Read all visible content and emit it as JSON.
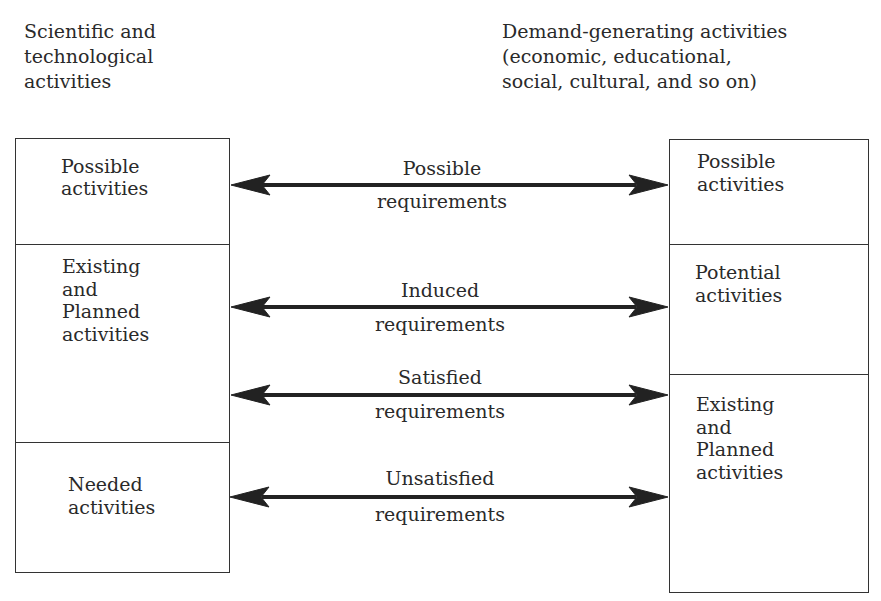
{
  "left_column": {
    "heading": "Scientific and\ntechnological\nactivities",
    "cells": [
      {
        "label": "Possible\n\nactivities"
      },
      {
        "label": "Existing\n\nand\n\nPlanned\n\nactivities"
      },
      {
        "label": "Needed\n\nactivities"
      }
    ]
  },
  "right_column": {
    "heading": "Demand-generating activities\n(economic, educational,\nsocial, cultural, and so on)",
    "cells": [
      {
        "label": "Possible\n\nactivities"
      },
      {
        "label": "Potential\n\nactivities"
      },
      {
        "label": "Existing\n\nand\n\nPlanned\n\nactivities"
      }
    ]
  },
  "arrows": [
    {
      "top": "Possible",
      "bottom": "requirements",
      "direction": "bidirectional"
    },
    {
      "top": "Induced",
      "bottom": "requirements",
      "direction": "bidirectional"
    },
    {
      "top": "Satisfied",
      "bottom": "requirements",
      "direction": "bidirectional"
    },
    {
      "top": "Unsatisfied",
      "bottom": "requirements",
      "direction": "bidirectional"
    }
  ]
}
